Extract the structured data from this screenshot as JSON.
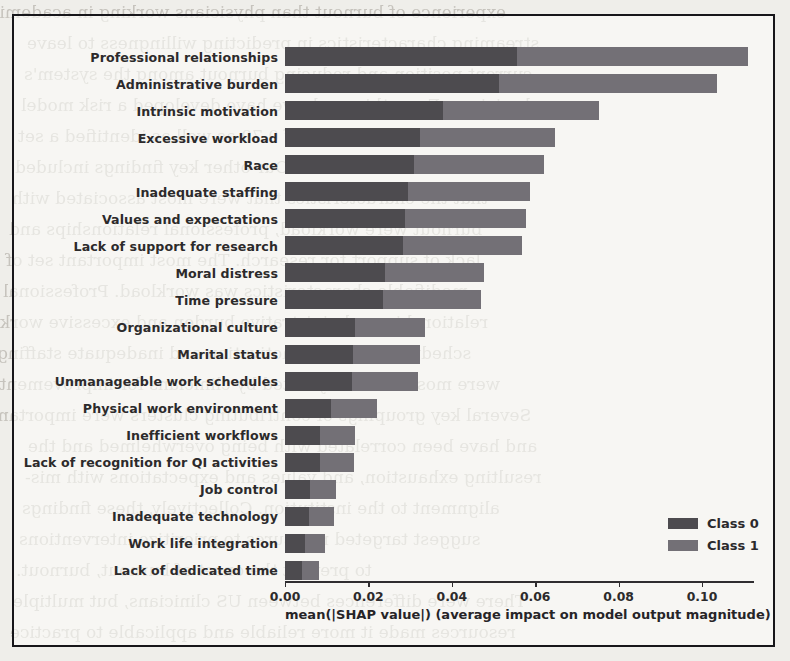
{
  "figure": {
    "frame": {
      "border_color": "#17161a"
    },
    "background": "#efeeea"
  },
  "legend": {
    "position": "lower-right",
    "entries": [
      {
        "label": "Class 0",
        "color": "#4d4b4f"
      },
      {
        "label": "Class 1",
        "color": "#737076"
      }
    ]
  },
  "axis": {
    "xlabel": "mean(|SHAP value|) (average impact on model output magnitude)",
    "ticks": [
      "0.00",
      "0.02",
      "0.04",
      "0.06",
      "0.08",
      "0.10"
    ],
    "tick_values": [
      0.0,
      0.02,
      0.04,
      0.06,
      0.08,
      0.1
    ],
    "xlim": [
      0.0,
      0.1175
    ]
  },
  "chart_data": {
    "type": "bar",
    "orientation": "horizontal",
    "stacked": true,
    "title": "",
    "xlabel": "mean(|SHAP value|) (average impact on model output magnitude)",
    "ylabel": "",
    "xlim": [
      0.0,
      0.1175
    ],
    "grid": false,
    "legend_position": "lower right",
    "categories": [
      "Professional relationships",
      "Administrative burden",
      "Intrinsic motivation",
      "Excessive workload",
      "Race",
      "Inadequate staffing",
      "Values and expectations",
      "Lack of support for research",
      "Moral distress",
      "Time pressure",
      "Organizational culture",
      "Marital status",
      "Unmanageable work schedules",
      "Physical work environment",
      "Inefficient workflows",
      "Lack of recognition for QI activities",
      "Job control",
      "Inadequate technology",
      "Work life integration",
      "Lack of dedicated time"
    ],
    "series": [
      {
        "name": "Class 0",
        "color": "#4d4b4f",
        "values": [
          0.0557,
          0.0513,
          0.038,
          0.0324,
          0.031,
          0.0294,
          0.0288,
          0.0283,
          0.0239,
          0.0235,
          0.0168,
          0.0163,
          0.016,
          0.011,
          0.0084,
          0.0083,
          0.0061,
          0.0058,
          0.0048,
          0.0041
        ]
      },
      {
        "name": "Class 1",
        "color": "#737076",
        "values": [
          0.0553,
          0.0522,
          0.0373,
          0.0324,
          0.0312,
          0.0294,
          0.0291,
          0.0285,
          0.0238,
          0.0234,
          0.0167,
          0.0161,
          0.0158,
          0.011,
          0.0083,
          0.0082,
          0.0062,
          0.0059,
          0.0047,
          0.0041
        ]
      }
    ],
    "totals": [
      0.111,
      0.1035,
      0.0753,
      0.0648,
      0.0622,
      0.0588,
      0.0579,
      0.0568,
      0.0477,
      0.0469,
      0.0335,
      0.0324,
      0.0318,
      0.022,
      0.0167,
      0.0165,
      0.0123,
      0.0117,
      0.0095,
      0.0082
    ]
  },
  "background_text": {
    "lines": [
      "experience of burnout than physicians working in academic",
      "streaming characteristics in predicting willingness to leave",
      "current position and reducing burnout among the system's",
      "physicians. From this work, we have developed a risk model",
      "of burnout yielding an AUC of 0.79 as well as identified a set",
      "of interventions. Our other key findings included",
      "that the characteristics that were most associated with",
      "burnout were workload, professional relationships and",
      "lack of support for research. The most important set of",
      "modifiable characteristics was workload. Professional",
      "relationships, administrative burden and excessive work",
      "schedules, intrinsic motivation and inadequate staffing",
      "were most commonly noted by clinicians for improvement.",
      "Several key groupings of contributing clusters were important",
      "and have been correlated with being overwhelmed and the",
      "resulting exhaustion, and values and expectations with mis-",
      "alignment to the institution. Collectively, these findings",
      "suggest targeted measures to prioritize interventions",
      "to prevent the onset of burnout, burnout.",
      "There were differences between US clinicians, but multiple",
      "resources made it more reliable and applicable to practice"
    ]
  }
}
